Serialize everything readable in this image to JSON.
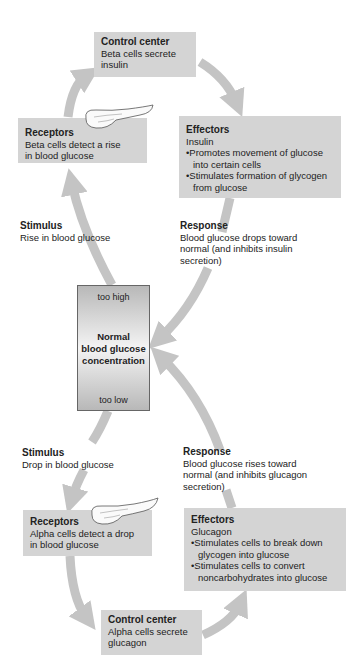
{
  "top_loop": {
    "control_center": {
      "title": "Control center",
      "lines": [
        "Beta cells secrete",
        "insulin"
      ]
    },
    "receptors": {
      "title": "Receptors",
      "lines": [
        "Beta cells detect a rise",
        "in blood glucose"
      ]
    },
    "effectors": {
      "title": "Effectors",
      "subtitle": "Insulin",
      "bullets": [
        "Promotes movement of glucose into certain cells",
        "Stimulates formation of glycogen from glucose"
      ]
    },
    "stimulus": {
      "title": "Stimulus",
      "text": "Rise in blood glucose"
    },
    "response": {
      "title": "Response",
      "lines": [
        "Blood glucose drops toward",
        "normal (and inhibits insulin",
        "secretion)"
      ]
    }
  },
  "center": {
    "too_high": "too high",
    "line1": "Normal",
    "line2": "blood glucose",
    "line3": "concentration",
    "too_low": "too low"
  },
  "bottom_loop": {
    "stimulus": {
      "title": "Stimulus",
      "text": "Drop in blood glucose"
    },
    "response": {
      "title": "Response",
      "lines": [
        "Blood glucose rises toward",
        "normal (and inhibits glucagon",
        "secretion)"
      ]
    },
    "receptors": {
      "title": "Receptors",
      "lines": [
        "Alpha cells detect a drop",
        "in blood glucose"
      ]
    },
    "effectors": {
      "title": "Effectors",
      "subtitle": "Glucagon",
      "bullets": [
        "Stimulates cells to break down glycogen into glucose",
        "Stimulates cells to convert noncarbohydrates into glucose"
      ]
    },
    "control_center": {
      "title": "Control center",
      "lines": [
        "Alpha cells secrete",
        "glucagon"
      ]
    }
  },
  "colors": {
    "box": "#d4d4d4",
    "arrow": "#c4c4c4",
    "text": "#222222"
  }
}
